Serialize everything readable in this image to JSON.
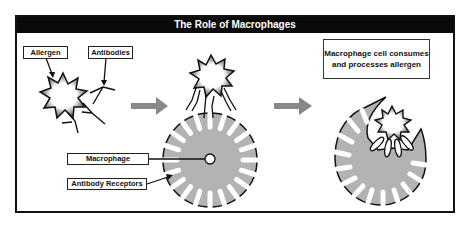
{
  "title": "The Role of Macrophages",
  "labels": {
    "allergen": "Allergen",
    "antibodies": "Antibodies",
    "macrophage": "Macrophage",
    "antibody_receptors": "Antibody Receptors"
  },
  "caption": {
    "line1": "Macrophage cell consumes",
    "line2": "and processes allergen"
  },
  "stages": [
    {
      "step": 1,
      "description": "Allergen and free antibodies"
    },
    {
      "step": 2,
      "description": "Antibodies bound to allergen attach to macrophage antibody receptors"
    },
    {
      "step": 3,
      "description": "Macrophage cell consumes and processes allergen"
    }
  ],
  "colors": {
    "title_bar": "#0a0a0a",
    "macrophage_fill": "#b3b3b3",
    "arrow": "#888888",
    "outline": "#111111"
  }
}
